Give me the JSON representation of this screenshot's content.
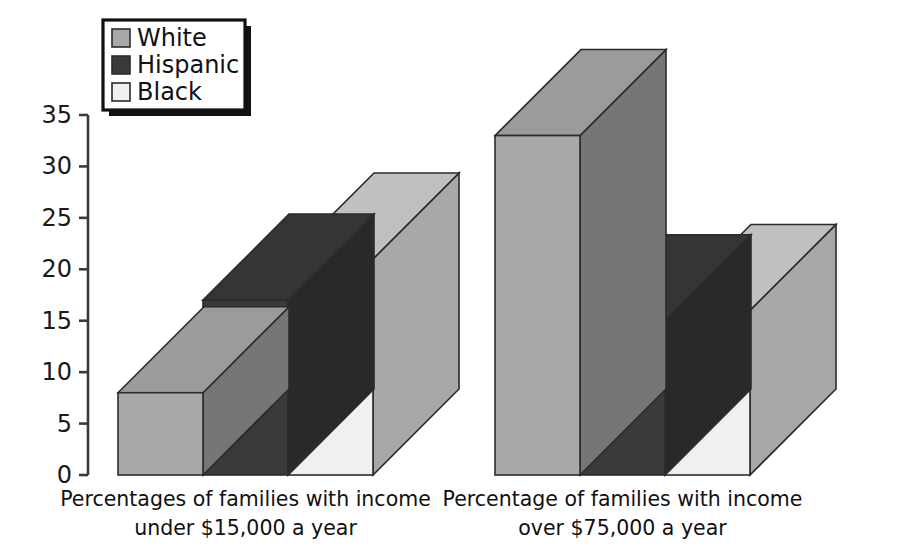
{
  "chart_data": {
    "type": "bar",
    "title": "",
    "subtitle": "",
    "xlabel": "",
    "ylabel": "",
    "ylim": [
      0,
      35
    ],
    "y_ticks": [
      0,
      5,
      10,
      15,
      20,
      25,
      30,
      35
    ],
    "grid": false,
    "legend_position": "top-left",
    "style": "3d-clustered-bars",
    "categories": [
      "Percentages of families with income under $15,000 a year",
      "Percentage of families with income over $75,000 a year"
    ],
    "category_lines": [
      [
        "Percentages of families with income",
        "under $15,000 a year"
      ],
      [
        "Percentage of families with income",
        "over $75,000 a year"
      ]
    ],
    "series": [
      {
        "name": "White",
        "values": [
          8,
          33
        ],
        "color": "#a8a8a8"
      },
      {
        "name": "Hispanic",
        "values": [
          17,
          15
        ],
        "color": "#3a3a3a"
      },
      {
        "name": "Black",
        "values": [
          21,
          16
        ],
        "color": "#f0f0f0"
      }
    ]
  },
  "legend": {
    "items": [
      {
        "label": "White",
        "swatch": "#a8a8a8"
      },
      {
        "label": "Hispanic",
        "swatch": "#3a3a3a"
      },
      {
        "label": "Black",
        "swatch": "#f0f0f0"
      }
    ]
  },
  "axis": {
    "y_tick_labels": [
      "35",
      "30",
      "25",
      "20",
      "15",
      "10",
      "5",
      "0"
    ]
  },
  "colors": {
    "white_series": "#a8a8a8",
    "hispanic_series": "#3a3a3a",
    "black_series": "#f0f0f0",
    "axis": "#3a3a3a",
    "outline": "#2b2b2b",
    "background": "#ffffff"
  }
}
